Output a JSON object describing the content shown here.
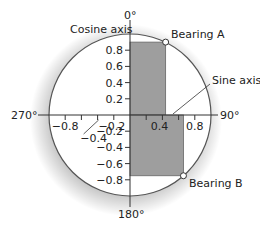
{
  "diagram": {
    "type": "unit-circle-bearings",
    "axis_labels": {
      "cosine_axis": "Cosine axis",
      "sine_axis": "Sine axis"
    },
    "compass_labels": {
      "north": "0°",
      "east": "90°",
      "south": "180°",
      "west": "270°"
    },
    "cosine_ticks": [
      {
        "value": 0.8,
        "label": "0.8"
      },
      {
        "value": 0.6,
        "label": "0.6"
      },
      {
        "value": 0.4,
        "label": "0.4"
      },
      {
        "value": 0.2,
        "label": "0.2"
      },
      {
        "value": -0.2,
        "label": "−0.2"
      },
      {
        "value": -0.4,
        "label": "−0.4"
      },
      {
        "value": -0.6,
        "label": "−0.6"
      },
      {
        "value": -0.8,
        "label": "−0.8"
      }
    ],
    "sine_ticks": [
      {
        "value": -0.8,
        "label": "−0.8"
      },
      {
        "value": -0.6,
        "label": ""
      },
      {
        "value": -0.4,
        "label": "−0.4"
      },
      {
        "value": -0.2,
        "label": "−0.2"
      },
      {
        "value": 0.2,
        "label": ""
      },
      {
        "value": 0.4,
        "label": "0.4"
      },
      {
        "value": 0.6,
        "label": ""
      },
      {
        "value": 0.8,
        "label": "0.8"
      }
    ],
    "bearings": [
      {
        "name": "Bearing A",
        "sine": 0.44,
        "cosine": 0.9
      },
      {
        "name": "Bearing B",
        "sine": 0.66,
        "cosine": -0.75
      }
    ],
    "colors": {
      "shade": "#9e9e9e",
      "line": "#333333",
      "circle": "#555555"
    }
  }
}
